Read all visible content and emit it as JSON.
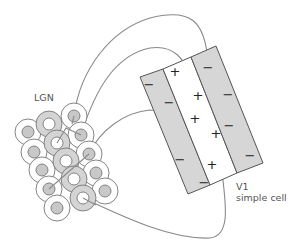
{
  "labels": {
    "lgn": "LGN",
    "v1_line1": "V1",
    "v1_line2": "simple cell"
  },
  "receptive_field": {
    "bands": [
      {
        "name": "left-off-band",
        "polarity": "-",
        "fill": "#d6d6d6",
        "signs": [
          "−",
          "−",
          "−",
          "−"
        ]
      },
      {
        "name": "center-on-band",
        "polarity": "+",
        "fill": "#ffffff",
        "signs": [
          "+",
          "+",
          "+",
          "+",
          "+"
        ]
      },
      {
        "name": "right-off-band",
        "polarity": "-",
        "fill": "#d6d6d6",
        "signs": [
          "−",
          "−",
          "−",
          "−"
        ]
      }
    ]
  },
  "lgn_cells": {
    "on_center_count": 10,
    "off_center_count": 5,
    "colors": {
      "ring_light": "#ffffff",
      "ring_dark": "#d4d4d4",
      "center_dark": "#c8c8c8",
      "center_light": "#ffffff",
      "stroke": "#777777"
    }
  },
  "colors": {
    "line": "#8a8a8a",
    "text": "#555555",
    "band_gray": "#d6d6d6"
  }
}
